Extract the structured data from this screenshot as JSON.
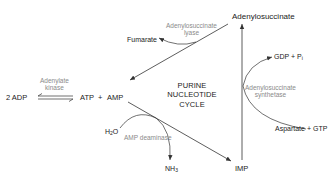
{
  "diagram": {
    "title": {
      "line1": "PURINE",
      "line2": "NUCLEOTIDE",
      "line3": "CYCLE"
    },
    "metabolites": {
      "adenylosuccinate": "Adenylosuccinate",
      "fumarate": "Fumarate",
      "adp": "2 ADP",
      "atp": "ATP",
      "plus": "+",
      "amp": "AMP",
      "gdp": "GDP + P",
      "gdp_sub": "i",
      "aspartate_gtp": "Aspartate + GTP",
      "h2o_h": "H",
      "h2o_sub": "2",
      "h2o_o": "O",
      "nh3_nh": "NH",
      "nh3_sub": "3",
      "imp": "IMP"
    },
    "enzymes": {
      "adenylosuccinate_lyase_1": "Adenylosuccinate",
      "adenylosuccinate_lyase_2": "lyase",
      "adenylate_kinase_1": "Adenylate",
      "adenylate_kinase_2": "kinase",
      "adenylosuccinate_synthetase_1": "Adenylosuccinate",
      "adenylosuccinate_synthetase_2": "synthetase",
      "amp_deaminase": "AMP deaminase"
    },
    "colors": {
      "line": "#333333",
      "text": "#222222",
      "enzyme_text": "#8a8a8a"
    }
  }
}
